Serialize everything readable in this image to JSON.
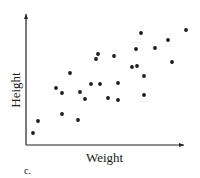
{
  "chart_data": {
    "type": "scatter",
    "title": "",
    "xlabel": "Weight",
    "ylabel": "Height",
    "caption": "c.",
    "grid": false,
    "legend": null,
    "ticks": false,
    "xlim": [
      0,
      160
    ],
    "ylim": [
      0,
      131
    ],
    "points": [
      {
        "x": 7,
        "y": 12
      },
      {
        "x": 12,
        "y": 24
      },
      {
        "x": 30,
        "y": 57
      },
      {
        "x": 36,
        "y": 52
      },
      {
        "x": 36,
        "y": 31
      },
      {
        "x": 44,
        "y": 72
      },
      {
        "x": 52,
        "y": 25
      },
      {
        "x": 54,
        "y": 53
      },
      {
        "x": 59,
        "y": 46
      },
      {
        "x": 65,
        "y": 61
      },
      {
        "x": 70,
        "y": 86
      },
      {
        "x": 72,
        "y": 91
      },
      {
        "x": 74,
        "y": 61
      },
      {
        "x": 82,
        "y": 47
      },
      {
        "x": 88,
        "y": 89
      },
      {
        "x": 92,
        "y": 62
      },
      {
        "x": 92,
        "y": 45
      },
      {
        "x": 106,
        "y": 78
      },
      {
        "x": 110,
        "y": 96
      },
      {
        "x": 111,
        "y": 79
      },
      {
        "x": 115,
        "y": 112
      },
      {
        "x": 118,
        "y": 69
      },
      {
        "x": 118,
        "y": 50
      },
      {
        "x": 129,
        "y": 97
      },
      {
        "x": 142,
        "y": 105
      },
      {
        "x": 146,
        "y": 83
      },
      {
        "x": 160,
        "y": 115
      }
    ]
  },
  "style": {
    "point_color": "#1a1a1a",
    "axis_color": "#222222"
  }
}
